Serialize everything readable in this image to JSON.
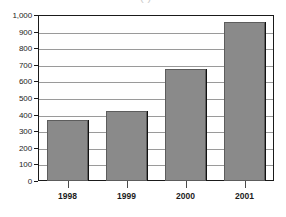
{
  "chart_data": {
    "type": "bar",
    "title": "",
    "title_remnant": "(                    )",
    "xlabel": "",
    "ylabel": "",
    "categories": [
      "1998",
      "1999",
      "2000",
      "2001"
    ],
    "values": [
      370,
      420,
      675,
      960
    ],
    "ylim": [
      0,
      1000
    ],
    "ytick_values": [
      0,
      100,
      200,
      300,
      400,
      500,
      600,
      700,
      800,
      900,
      1000
    ],
    "ytick_labels": [
      "0",
      "100",
      "200",
      "300",
      "400",
      "500",
      "600",
      "700",
      "800",
      "900",
      "1,000"
    ],
    "grid": true,
    "legend": "none",
    "bar_color": "#8a8a8a",
    "bar_border_color": "#5d5d5d",
    "bar_shadow_color": "#111111",
    "gridline_color": "#9a9a9a",
    "frame_color": "#1a1a1a",
    "text_color": "#1c1c1c",
    "background": "#ffffff"
  }
}
